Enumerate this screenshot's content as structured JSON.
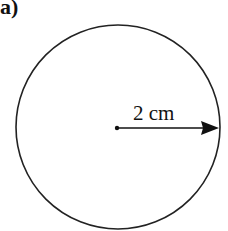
{
  "figure": {
    "part_label": "a)",
    "shape": "circle",
    "radius_label": "2 cm",
    "stroke_color": "#222222",
    "circle": {
      "cx": 118,
      "cy": 127,
      "r": 102
    },
    "radius_arrow": {
      "from": [
        117,
        128
      ],
      "to": [
        219,
        128
      ]
    }
  }
}
